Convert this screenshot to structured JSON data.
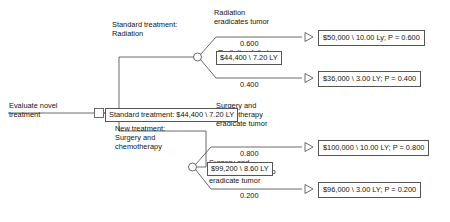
{
  "diagram": {
    "type": "decision-tree",
    "title_label": "Evaluate novel treatment",
    "root": {
      "node_type": "decision-square",
      "label": "Evaluate novel treatment",
      "rollback_box": "Standard treatment: $44,400 \\ 7.20 LY"
    },
    "branches": [
      {
        "id": "standard",
        "label_line1": "Standard treatment:",
        "label_line2": "Radiation",
        "node_type": "chance-circle",
        "rollback_box": "$44,400 \\ 7.20 LY",
        "outcomes": [
          {
            "label_line1": "Radiation",
            "label_line2": "eradicates tumor",
            "probability": "0.600",
            "payoff": "$50,000 \\ 10.00 Ly; P = 0.600",
            "terminal": "triangle"
          },
          {
            "label_line1": "Radiation fails to",
            "label_line2": "eradicate tumor",
            "probability": "0.400",
            "payoff": "$36,000 \\ 3.00 LY; P = 0.400",
            "terminal": "triangle"
          }
        ]
      },
      {
        "id": "new",
        "label_line1": "New treatment:",
        "label_line2": "Surgery and",
        "label_line3": "chemotherapy",
        "node_type": "chance-circle",
        "rollback_box": "$99,200 \\ 8.60 LY",
        "outcomes": [
          {
            "label_line1": "Surgery and",
            "label_line2": "chemotherapy",
            "label_line3": "eradicate tumor",
            "probability": "0.800",
            "payoff": "$100,000 \\ 10.00 LY; P = 0.800",
            "terminal": "triangle"
          },
          {
            "label_line1": "Surgery and",
            "label_line2": "chemotherapy fail to",
            "label_line3": "eradicate tumor",
            "probability": "0.200",
            "payoff": "$96,000 \\ 3.00 LY; P = 0.200",
            "terminal": "triangle"
          }
        ]
      }
    ],
    "colors": {
      "line": "#5a5a5a",
      "box_border": "#555555",
      "text": "#141414",
      "background": "#ffffff"
    }
  }
}
